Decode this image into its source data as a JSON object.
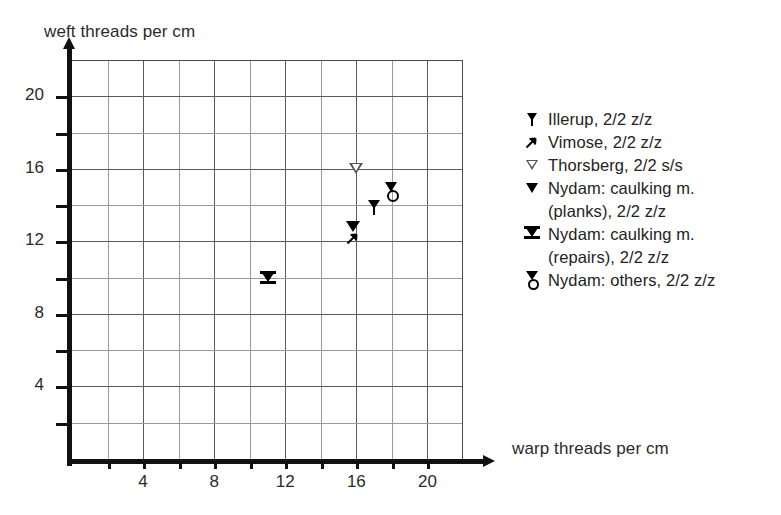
{
  "chart_data": {
    "type": "scatter",
    "title": "",
    "xlabel": "warp threads per cm",
    "ylabel": "weft threads per cm",
    "xlim": [
      0,
      22
    ],
    "ylim": [
      0,
      22
    ],
    "grid": true,
    "grid_step": 2,
    "xticks": [
      4,
      8,
      12,
      16,
      20
    ],
    "yticks": [
      4,
      8,
      12,
      16,
      20
    ],
    "xtick_labels": [
      "4",
      "8",
      "12",
      "16",
      "20"
    ],
    "ytick_labels": [
      "4",
      "8",
      "12",
      "16",
      "20"
    ],
    "legend_position": "right",
    "series": [
      {
        "name": "Illerup, 2/2 z/z",
        "marker": "pin-down-triangle",
        "points": [
          {
            "x": 17.0,
            "y": 14.0
          }
        ]
      },
      {
        "name": "Vimose, 2/2 z/z",
        "marker": "arrow-up-right",
        "points": [
          {
            "x": 15.8,
            "y": 12.2
          }
        ]
      },
      {
        "name": "Thorsberg, 2/2 s/s",
        "marker": "open-down-triangle",
        "points": [
          {
            "x": 16.0,
            "y": 16.0
          }
        ]
      },
      {
        "name": "Nydam: caulking m. (planks), 2/2 z/z",
        "marker": "filled-down-triangle",
        "points": [
          {
            "x": 15.8,
            "y": 12.8
          }
        ]
      },
      {
        "name": "Nydam: caulking m. (repairs), 2/2 z/z",
        "marker": "barred-down-triangle",
        "points": [
          {
            "x": 11.0,
            "y": 10.0
          }
        ]
      },
      {
        "name": "Nydam: others, 2/2 z/z",
        "marker": "triangle-over-circle",
        "points": [
          {
            "x": 18.0,
            "y": 14.8
          }
        ]
      }
    ]
  },
  "axes": {
    "y_title": "weft threads per cm",
    "x_title": "warp threads per cm"
  },
  "legend": {
    "entries": [
      {
        "marker": "pin-down-triangle",
        "label": "Illerup, 2/2 z/z",
        "label_line2": ""
      },
      {
        "marker": "arrow-up-right",
        "label": "Vimose, 2/2 z/z",
        "label_line2": ""
      },
      {
        "marker": "open-down-triangle",
        "label": "Thorsberg, 2/2 s/s",
        "label_line2": ""
      },
      {
        "marker": "filled-down-triangle",
        "label": "Nydam: caulking m.",
        "label_line2": "(planks), 2/2 z/z"
      },
      {
        "marker": "barred-down-triangle",
        "label": "Nydam: caulking m.",
        "label_line2": "(repairs), 2/2 z/z"
      },
      {
        "marker": "triangle-over-circle",
        "label": "Nydam: others, 2/2 z/z",
        "label_line2": ""
      }
    ]
  },
  "caption": {
    "text": ""
  }
}
